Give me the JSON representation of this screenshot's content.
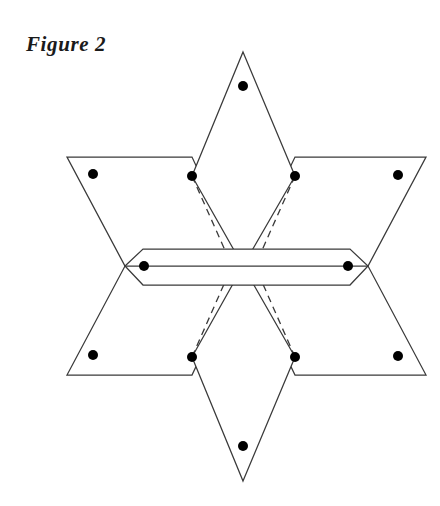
{
  "figure": {
    "caption": "Figure 2",
    "background_color": "#ffffff",
    "stroke_color": "#3a3a3a",
    "dot_color": "#000000",
    "width": 440,
    "height": 506
  },
  "geometry": {
    "description": "Six-pointed star net: two overlapping triangles forming left and right wings, a vertical diamond (upper and lower points), and a horizontal bar strip across the centre, with twelve marked vertex dots and four dashed fold lines.",
    "center": {
      "x": 243,
      "y": 266
    },
    "shapes": [
      {
        "name": "upper-diamond",
        "kind": "polygon",
        "points": "243,52 295,176 243,266 192,176"
      },
      {
        "name": "lower-diamond",
        "kind": "polygon",
        "points": "243,481 295,357 243,266 192,357"
      },
      {
        "name": "left-upper-wing",
        "kind": "polygon",
        "points": "67,157 192,157 243,266 125,266"
      },
      {
        "name": "right-upper-wing",
        "kind": "polygon",
        "points": "426,157 295,157 243,266 368,266"
      },
      {
        "name": "left-lower-wing",
        "kind": "polygon",
        "points": "67,375 192,375 243,266 125,266"
      },
      {
        "name": "right-lower-wing",
        "kind": "polygon",
        "points": "426,375 295,375 243,266 368,266"
      },
      {
        "name": "horizontal-bar",
        "kind": "polygon",
        "points": "125,266 143,249 350,249 368,266 350,285 143,285"
      },
      {
        "name": "horizontal-bar-midline",
        "kind": "line",
        "x1": 125,
        "y1": 266,
        "x2": 368,
        "y2": 266
      }
    ],
    "fold_lines_dashed": [
      {
        "name": "fold-upper-left",
        "x1": 192,
        "y1": 176,
        "x2": 232,
        "y2": 266
      },
      {
        "name": "fold-upper-right",
        "x1": 295,
        "y1": 176,
        "x2": 255,
        "y2": 266
      },
      {
        "name": "fold-lower-left",
        "x1": 192,
        "y1": 357,
        "x2": 232,
        "y2": 266
      },
      {
        "name": "fold-lower-right",
        "x1": 295,
        "y1": 357,
        "x2": 255,
        "y2": 266
      }
    ],
    "dots": [
      {
        "name": "dot-top-apex",
        "x": 243,
        "y": 86,
        "r": 5
      },
      {
        "name": "dot-upper-diamond-left",
        "x": 192,
        "y": 176,
        "r": 5
      },
      {
        "name": "dot-upper-diamond-right",
        "x": 295,
        "y": 176,
        "r": 5
      },
      {
        "name": "dot-left-wing-upper",
        "x": 93,
        "y": 174,
        "r": 5
      },
      {
        "name": "dot-right-wing-upper",
        "x": 398,
        "y": 175,
        "r": 5
      },
      {
        "name": "dot-bar-left",
        "x": 144,
        "y": 266,
        "r": 5
      },
      {
        "name": "dot-bar-right",
        "x": 348,
        "y": 266,
        "r": 5
      },
      {
        "name": "dot-left-wing-lower",
        "x": 93,
        "y": 355,
        "r": 5
      },
      {
        "name": "dot-right-wing-lower",
        "x": 398,
        "y": 356,
        "r": 5
      },
      {
        "name": "dot-lower-diamond-left",
        "x": 192,
        "y": 357,
        "r": 5
      },
      {
        "name": "dot-lower-diamond-right",
        "x": 295,
        "y": 357,
        "r": 5
      },
      {
        "name": "dot-bottom-apex",
        "x": 243,
        "y": 446,
        "r": 5
      }
    ]
  }
}
